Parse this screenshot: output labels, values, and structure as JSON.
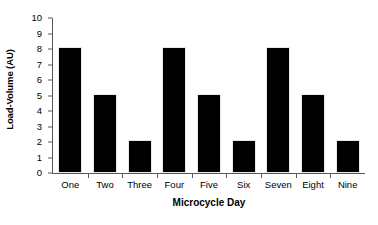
{
  "chart_data": {
    "type": "bar",
    "title": "",
    "xlabel": "Microcycle Day",
    "ylabel": "Load-Volume (AU)",
    "categories": [
      "One",
      "Two",
      "Three",
      "Four",
      "Five",
      "Six",
      "Seven",
      "Eight",
      "Nine"
    ],
    "values": [
      8,
      5,
      2,
      8,
      5,
      2,
      8,
      5,
      2
    ],
    "ylim": [
      0,
      10
    ],
    "yticks": [
      0,
      1,
      2,
      3,
      4,
      5,
      6,
      7,
      8,
      9,
      10
    ],
    "ytick_labels": [
      "0",
      "1",
      "2",
      "3",
      "4",
      "5",
      "6",
      "7",
      "8",
      "9",
      "10"
    ],
    "grid": false,
    "legend": false,
    "bar_color": "#000000",
    "axis_color": "#58585a",
    "background": "#ffffff"
  }
}
